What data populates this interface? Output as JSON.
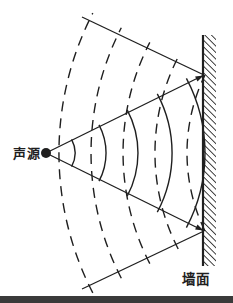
{
  "diagram": {
    "title_hint": "sound wave reflection off a wall",
    "source": {
      "label": "声源",
      "x": 46,
      "y": 153,
      "dot_radius": 5,
      "label_x": 40,
      "label_y": 157.5
    },
    "wall": {
      "label": "墙面",
      "face_x": 203,
      "top_y": 35,
      "bottom_y": 266,
      "thickness": 13,
      "label_x": 196,
      "label_y": 284
    },
    "waves": {
      "incident": {
        "style": "solid",
        "center_x": 46,
        "center_y": 153,
        "radii": [
          29,
          60,
          92,
          126,
          159
        ],
        "half_span_deg": 28
      },
      "reflected": {
        "style": "dashed",
        "center_x": 365,
        "center_y": 153,
        "radii": [
          178,
          210,
          242,
          274,
          306
        ],
        "half_span_deg": 27.2,
        "first_half_span_deg": 26
      }
    },
    "rays": {
      "incident": [
        {
          "x1": 49,
          "y1": 151.5,
          "x2": 204,
          "y2": 75
        },
        {
          "x1": 49,
          "y1": 154.5,
          "x2": 204,
          "y2": 231
        }
      ],
      "reflected": [
        {
          "x1": 204,
          "y1": 75,
          "x2": 82,
          "y2": 17
        },
        {
          "x1": 204,
          "y1": 231,
          "x2": 82,
          "y2": 289
        }
      ]
    },
    "arrows": [
      {
        "x": 203.5,
        "y": 75.5,
        "deg": -26.3,
        "length": 8,
        "half_width": 2.7
      },
      {
        "x": 203.5,
        "y": 230.5,
        "deg": 26.3,
        "length": 8,
        "half_width": 2.7
      }
    ],
    "bottom_bar": {
      "y": 296,
      "height": 7
    },
    "colors": {
      "ink": "#1f1f1f",
      "background": "#ffffff",
      "bottom_bar": "#3a3a3a"
    }
  }
}
